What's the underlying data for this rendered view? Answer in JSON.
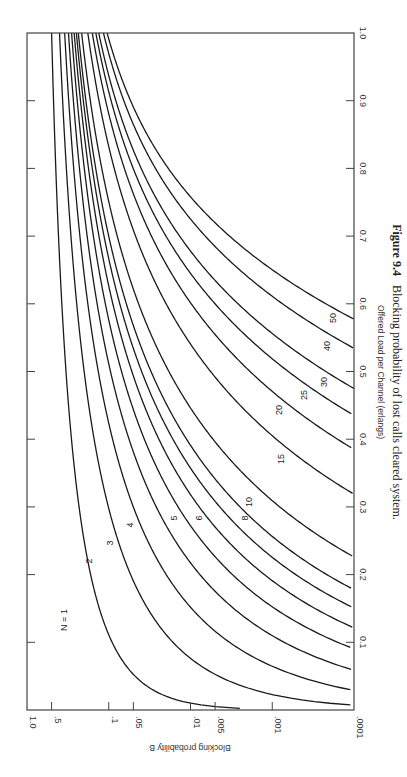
{
  "figure": {
    "number": "Figure 9.4",
    "caption": "Blocking probability of lost calls cleared system.",
    "orientation": "rotated 90° clockwise on page"
  },
  "chart_data": {
    "type": "line",
    "title": "Blocking probability of lost calls cleared system.",
    "xlabel": "Offered Load per Channel (erlangs)",
    "ylabel": "Blocking probability B",
    "xlim": [
      0,
      1.0
    ],
    "ylim": [
      0.0001,
      1.0
    ],
    "yscale": "log",
    "grid": false,
    "legend": "inline curve labels",
    "x_ticks": [
      "0.1",
      "0.2",
      "0.3",
      "0.4",
      "0.5",
      "0.6",
      "0.7",
      "0.8",
      "0.9",
      "1.0"
    ],
    "y_ticks": [
      "1.0",
      ".5",
      ".1",
      ".05",
      ".01",
      ".005",
      ".001",
      ".0001"
    ],
    "y_tick_values": [
      1.0,
      0.5,
      0.1,
      0.05,
      0.01,
      0.005,
      0.001,
      0.0001
    ],
    "series": [
      {
        "name": "N = 1",
        "N": 1,
        "label": "N = 1"
      },
      {
        "name": "2",
        "N": 2,
        "label": "2"
      },
      {
        "name": "3",
        "N": 3,
        "label": "3"
      },
      {
        "name": "4",
        "N": 4,
        "label": "4"
      },
      {
        "name": "5",
        "N": 5,
        "label": "5"
      },
      {
        "name": "6",
        "N": 6,
        "label": "6"
      },
      {
        "name": "7",
        "N": 7,
        "label": ""
      },
      {
        "name": "8",
        "N": 8,
        "label": "8"
      },
      {
        "name": "10",
        "N": 10,
        "label": "10"
      },
      {
        "name": "15",
        "N": 15,
        "label": "15"
      },
      {
        "name": "20",
        "N": 20,
        "label": "20"
      },
      {
        "name": "25",
        "N": 25,
        "label": "25"
      },
      {
        "name": "30",
        "N": 30,
        "label": "30"
      },
      {
        "name": "40",
        "N": 40,
        "label": "40"
      },
      {
        "name": "50",
        "N": 50,
        "label": "50"
      }
    ],
    "sample_points": {
      "load_per_channel": [
        0.1,
        0.2,
        0.3,
        0.4,
        0.5,
        0.6,
        0.8,
        1.0
      ],
      "N=1": [
        0.091,
        0.167,
        0.231,
        0.286,
        0.333,
        0.375,
        0.444,
        0.5
      ],
      "N=2": [
        0.016,
        0.054,
        0.1,
        0.149,
        0.2,
        0.247,
        0.329,
        0.4
      ],
      "N=5": [
        0.0002,
        0.0037,
        0.0201,
        0.0597,
        0.11,
        0.165,
        0.264,
        0.285
      ],
      "N=10": [
        0.0,
        2e-05,
        0.0008,
        0.0085,
        0.0184,
        0.075,
        0.18,
        0.215
      ],
      "N=50": [
        0.0,
        0.0,
        0.0,
        0.0,
        0.0,
        0.0002,
        0.07,
        0.105
      ]
    }
  }
}
